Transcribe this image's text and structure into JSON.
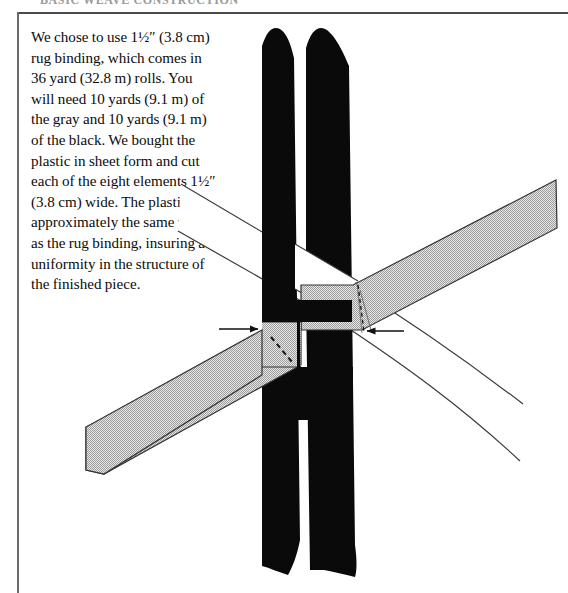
{
  "page": {
    "running_head": "BASIC WEAVE CONSTRUCTION",
    "frame_color": "#4a4a4a",
    "background": "#ffffff"
  },
  "body_text": {
    "paragraph": "We chose to use 1½″ (3.8 cm) rug binding, which comes in 36 yard (32.8 m) rolls. You will need 10 yards (9.1 m) of the gray and 10 yards (9.1 m) of the black. We bought the plastic in sheet form and cut each of the eight elements 1½″ (3.8 cm) wide. The plastic is approximately the same weight as the rug binding, insuring a uniformity in the structure of the finished piece."
  },
  "diagram": {
    "colors": {
      "black_strap": "#0a0a0a",
      "gray_strap_fill": "#c9c9c9",
      "gray_strap_stroke": "#333333",
      "outline_stroke": "#3a3a3a",
      "arrow": "#111111",
      "dashed_guide": "#141414",
      "white": "#ffffff"
    },
    "elements": [
      {
        "name": "black-vertical-strap-left",
        "kind": "filled-band",
        "orientation": "vertical",
        "fill": "#0a0a0a"
      },
      {
        "name": "black-vertical-strap-right",
        "kind": "filled-band",
        "orientation": "vertical",
        "fill": "#0a0a0a"
      },
      {
        "name": "gray-strap-descending",
        "kind": "hatched-band",
        "orientation": "diagonal-down-left",
        "fill": "#c9c9c9"
      },
      {
        "name": "white-strap-descending",
        "kind": "outline-band",
        "orientation": "diagonal-down-right",
        "fill": "#ffffff"
      },
      {
        "name": "arrow-left-pointer",
        "kind": "annotation-arrow",
        "direction": "right"
      },
      {
        "name": "arrow-right-pointer",
        "kind": "annotation-arrow",
        "direction": "left"
      },
      {
        "name": "dashed-width-guide-left",
        "kind": "dashed-line"
      },
      {
        "name": "dashed-width-guide-right",
        "kind": "dashed-line"
      }
    ]
  }
}
